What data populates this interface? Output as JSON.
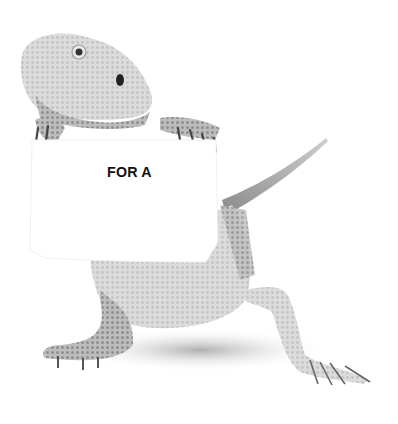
{
  "image": {
    "subject": "bearded dragon lizard holding a sign",
    "style": "grayscale photo on white background",
    "sign": {
      "text": "FOR A"
    },
    "colors": {
      "background": "#ffffff",
      "lizard_light": "#e6e6e6",
      "lizard_mid": "#bdbdbd",
      "lizard_dark": "#6e6e6e",
      "sign_text": "#111111"
    }
  }
}
